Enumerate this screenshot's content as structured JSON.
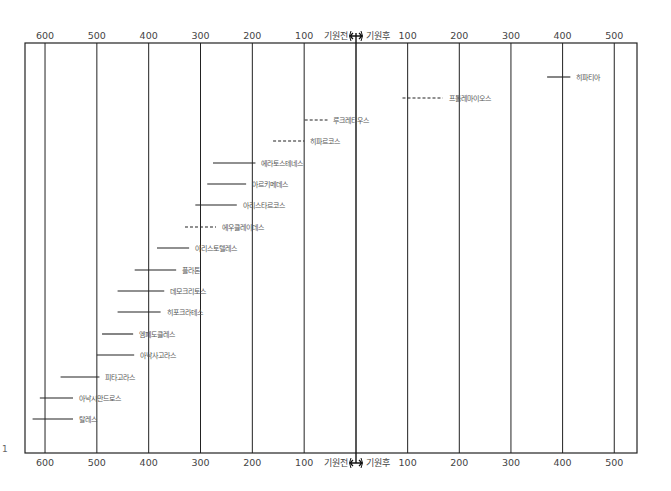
{
  "chart_data": {
    "type": "timeline",
    "title": "",
    "xlabel": "",
    "ylabel": "",
    "axis": {
      "bc_ticks": [
        600,
        500,
        400,
        300,
        200,
        100
      ],
      "ad_ticks": [
        100,
        200,
        300,
        400,
        500
      ],
      "bc_label": "기원전",
      "ad_label": "기원후",
      "divider_symbol": "↔",
      "range": [
        -640,
        540
      ]
    },
    "grid": true,
    "series": [
      {
        "name": "히파티아",
        "start": 370,
        "end": 415,
        "dashed": false
      },
      {
        "name": "프톨레마이오스",
        "start": 90,
        "end": 168,
        "dashed": true
      },
      {
        "name": "루크레티우스",
        "start": -99,
        "end": -55,
        "dashed": true
      },
      {
        "name": "히파르코스",
        "start": -160,
        "end": -100,
        "dashed": true
      },
      {
        "name": "에라토스테네스",
        "start": -276,
        "end": -194,
        "dashed": false
      },
      {
        "name": "아르키메데스",
        "start": -287,
        "end": -212,
        "dashed": false
      },
      {
        "name": "아리스타르코스",
        "start": -310,
        "end": -230,
        "dashed": false
      },
      {
        "name": "에우클레이데스",
        "start": -330,
        "end": -270,
        "dashed": true
      },
      {
        "name": "아리스토텔레스",
        "start": -384,
        "end": -322,
        "dashed": false
      },
      {
        "name": "플라톤",
        "start": -427,
        "end": -347,
        "dashed": false
      },
      {
        "name": "데모크리토스",
        "start": -460,
        "end": -370,
        "dashed": false
      },
      {
        "name": "히포크라테스",
        "start": -460,
        "end": -377,
        "dashed": false
      },
      {
        "name": "엠페도클레스",
        "start": -490,
        "end": -430,
        "dashed": false
      },
      {
        "name": "아낙사고라스",
        "start": -500,
        "end": -428,
        "dashed": false
      },
      {
        "name": "피타고라스",
        "start": -570,
        "end": -495,
        "dashed": false
      },
      {
        "name": "아낙시만드로스",
        "start": -610,
        "end": -546,
        "dashed": false
      },
      {
        "name": "탈레스",
        "start": -624,
        "end": -546,
        "dashed": false
      }
    ]
  },
  "page": {
    "side_note": "1"
  }
}
